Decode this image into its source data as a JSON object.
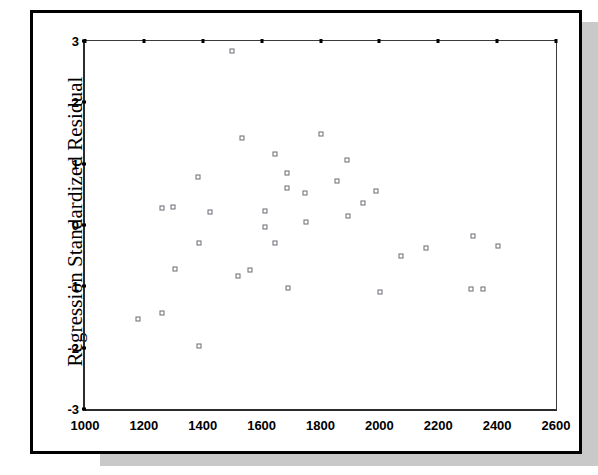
{
  "chart_data": {
    "type": "scatter",
    "title": "",
    "xlabel": "",
    "ylabel": "Regression Standardized Residual",
    "xlim": [
      1000,
      2600
    ],
    "ylim": [
      -3,
      3
    ],
    "xticks": [
      1000,
      1200,
      1400,
      1600,
      1800,
      2000,
      2200,
      2400,
      2600
    ],
    "yticks": [
      3,
      2,
      1,
      0,
      -1,
      -2,
      -3
    ],
    "xtick_labels": [
      "1000",
      "1200",
      "1400",
      "1600",
      "1800",
      "2000",
      "2200",
      "2400",
      "2600"
    ],
    "ytick_labels": [
      "3",
      "2",
      "1",
      "0",
      "-1",
      "-2",
      "-3"
    ],
    "grid": false,
    "legend": false,
    "marker_style": "open-square",
    "points": [
      {
        "x": 1180,
        "y": -1.53
      },
      {
        "x": 1262,
        "y": -1.44
      },
      {
        "x": 1262,
        "y": 0.28
      },
      {
        "x": 1300,
        "y": 0.3
      },
      {
        "x": 1305,
        "y": -0.72
      },
      {
        "x": 1385,
        "y": 0.78
      },
      {
        "x": 1388,
        "y": -0.29
      },
      {
        "x": 1388,
        "y": -1.98
      },
      {
        "x": 1425,
        "y": 0.22
      },
      {
        "x": 1498,
        "y": 2.84
      },
      {
        "x": 1520,
        "y": -0.83
      },
      {
        "x": 1532,
        "y": 1.42
      },
      {
        "x": 1560,
        "y": -0.73
      },
      {
        "x": 1612,
        "y": 0.23
      },
      {
        "x": 1612,
        "y": -0.04
      },
      {
        "x": 1645,
        "y": 1.15
      },
      {
        "x": 1645,
        "y": -0.3
      },
      {
        "x": 1685,
        "y": 0.84
      },
      {
        "x": 1685,
        "y": 0.6
      },
      {
        "x": 1690,
        "y": -1.03
      },
      {
        "x": 1748,
        "y": 0.52
      },
      {
        "x": 1752,
        "y": 0.05
      },
      {
        "x": 1802,
        "y": 1.49
      },
      {
        "x": 1855,
        "y": 0.72
      },
      {
        "x": 1890,
        "y": 1.06
      },
      {
        "x": 1892,
        "y": 0.15
      },
      {
        "x": 1945,
        "y": 0.36
      },
      {
        "x": 1988,
        "y": 0.56
      },
      {
        "x": 2002,
        "y": -1.1
      },
      {
        "x": 2075,
        "y": -0.5
      },
      {
        "x": 2158,
        "y": -0.38
      },
      {
        "x": 2312,
        "y": -1.05
      },
      {
        "x": 2318,
        "y": -0.18
      },
      {
        "x": 2352,
        "y": -1.04
      },
      {
        "x": 2402,
        "y": -0.35
      }
    ]
  }
}
